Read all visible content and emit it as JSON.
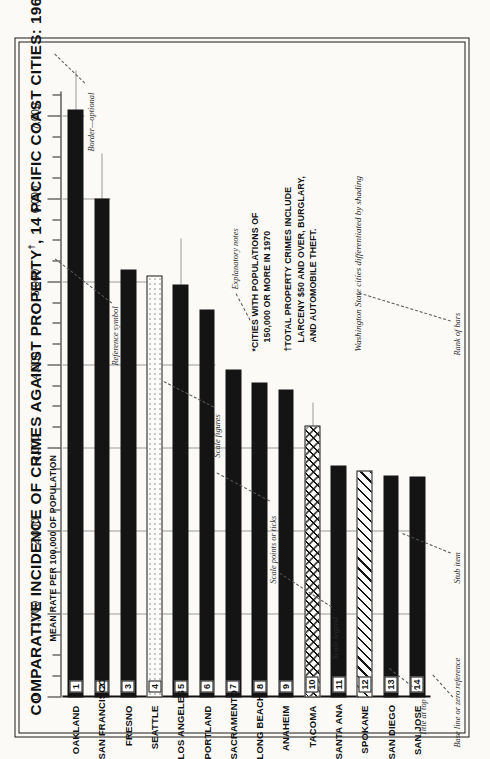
{
  "chart_data": {
    "type": "bar",
    "title": "COMPARATIVE INCIDENCE OF CRIMES AGAINST PROPERTY†, 14 PACIFIC COAST CITIES: 1968-1970*",
    "title_main": "COMPARATIVE INCIDENCE OF CRIMES AGAINST PROPERTY",
    "title_dagger": "†",
    "title_tail": ", 14 PACIFIC COAST CITIES: 1968-1970",
    "title_asterisk": "*",
    "subtitle": "MEAN RATE PER 100,000 OF POPULATION",
    "xlabel": "",
    "ylabel": "MEAN RATE PER 100,000 OF POPULATION",
    "orientation": "horizontal",
    "grid": true,
    "legend_position": "none",
    "axis_min": 0,
    "axis_max": 7300,
    "tick_labels": [
      "0",
      "1,000",
      "2,000",
      "3,000",
      "4,000",
      "5,000",
      "6,000",
      "7,000"
    ],
    "tick_values": [
      0,
      1000,
      2000,
      3000,
      4000,
      5000,
      6000,
      7000
    ],
    "minor_tick_step": 250,
    "gridline_values": [
      1000,
      2000,
      3000,
      4000,
      5000,
      6000,
      7000
    ],
    "categories": [
      "OAKLAND",
      "SAN FRANCISCO",
      "FRESNO",
      "SEATTLE",
      "LOS ANGELES",
      "PORTLAND",
      "SACRAMENTO",
      "LONG BEACH",
      "ANAHEIM",
      "TACOMA",
      "SANTA ANA",
      "SPOKANE",
      "SAN DIEGO",
      "SAN JOSE"
    ],
    "values": [
      7080,
      6010,
      5160,
      5090,
      4980,
      4670,
      3950,
      3790,
      3710,
      3280,
      2790,
      2730,
      2670,
      2660
    ],
    "ranks": [
      "1",
      "2",
      "3",
      "4",
      "5",
      "6",
      "7",
      "8",
      "9",
      "10",
      "11",
      "12",
      "13",
      "14"
    ],
    "fills": [
      "solid",
      "solid",
      "solid",
      "dotted",
      "solid",
      "solid",
      "solid",
      "solid",
      "solid",
      "cross",
      "solid",
      "diag",
      "solid",
      "solid"
    ],
    "bars": [
      {
        "rank": "1",
        "city": "OAKLAND",
        "value": 7080,
        "fill": "solid"
      },
      {
        "rank": "2",
        "city": "SAN FRANCISCO",
        "value": 6010,
        "fill": "solid"
      },
      {
        "rank": "3",
        "city": "FRESNO",
        "value": 5160,
        "fill": "solid"
      },
      {
        "rank": "4",
        "city": "SEATTLE",
        "value": 5090,
        "fill": "dotted"
      },
      {
        "rank": "5",
        "city": "LOS ANGELES",
        "value": 4980,
        "fill": "solid"
      },
      {
        "rank": "6",
        "city": "PORTLAND",
        "value": 4670,
        "fill": "solid"
      },
      {
        "rank": "7",
        "city": "SACRAMENTO",
        "value": 3950,
        "fill": "solid"
      },
      {
        "rank": "8",
        "city": "LONG BEACH",
        "value": 3790,
        "fill": "solid"
      },
      {
        "rank": "9",
        "city": "ANAHEIM",
        "value": 3710,
        "fill": "solid"
      },
      {
        "rank": "10",
        "city": "TACOMA",
        "value": 3280,
        "fill": "cross"
      },
      {
        "rank": "11",
        "city": "SANTA ANA",
        "value": 2790,
        "fill": "solid"
      },
      {
        "rank": "12",
        "city": "SPOKANE",
        "value": 2730,
        "fill": "diag"
      },
      {
        "rank": "13",
        "city": "SAN DIEGO",
        "value": 2670,
        "fill": "solid"
      },
      {
        "rank": "14",
        "city": "SAN JOSE",
        "value": 2660,
        "fill": "solid"
      }
    ],
    "annotations": [
      "*CITIES WITH POPULATIONS OF 150,000 OR MORE IN 1970",
      "†TOTAL PROPERTY CRIMES INCLUDE LARCENY $50 AND OVER, BURGLARY, AND AUTOMOBILE THEFT.",
      "Washington State cities differentiated by shading"
    ]
  },
  "notes": {
    "note1_line1": "*CITIES WITH POPULATIONS OF",
    "note1_line2": "150,000 OR MORE IN 1970",
    "note2_line1": "†TOTAL PROPERTY CRIMES INCLUDE",
    "note2_line2": "LARCENY $50 AND OVER, BURGLARY,",
    "note2_line3": "AND AUTOMOBILE THEFT."
  },
  "shading_note": "Washington State cities differentiated by shading",
  "callouts": {
    "title_at_top": "Title at top",
    "scale_legend": "Scale legend",
    "scale_points": "Scale points or ticks",
    "scale_figures": "Scale figures",
    "reference_symbol": "Reference symbol",
    "border_optional": "Border—optional",
    "explanatory_notes": "Explanatory notes",
    "base_line": "Base line or zero reference",
    "stub_item": "Stub item",
    "rank_of_bars": "Rank of bars"
  },
  "colors": {
    "ink": "#141414",
    "paper": "#fbfaf7",
    "grid": "#9a9a9a",
    "callout": "#2b2b2b"
  }
}
